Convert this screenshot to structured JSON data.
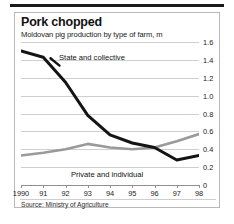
{
  "header": {
    "title": "Pork chopped",
    "subtitle": "Moldovan pig production by type of farm, m"
  },
  "footer": {
    "source": "Source: Ministry of Agriculture"
  },
  "colors": {
    "series_state": "#141414",
    "series_private": "#9a9a9a",
    "gridline": "#cfcfcf",
    "axis": "#8f8f8f",
    "frame": "#b9b9b9",
    "top_rule": "#1a1a1a",
    "text": "#1b1b1b",
    "background": "#ffffff"
  },
  "chart_data": {
    "type": "line",
    "title": "Pork chopped",
    "subtitle": "Moldovan pig production by type of farm, m",
    "xlabel": "",
    "ylabel": "",
    "categories": [
      "1990",
      "91",
      "92",
      "93",
      "94",
      "95",
      "96",
      "97",
      "98"
    ],
    "x_tick_labels": [
      "1990",
      "91",
      "92",
      "93",
      "94",
      "95",
      "96",
      "97",
      "98"
    ],
    "y_tick_labels": [
      "1.6",
      "1.4",
      "1.2",
      "1.0",
      "0.8",
      "0.6",
      "0.4",
      "0.2",
      "0"
    ],
    "y_ticks": [
      1.6,
      1.4,
      1.2,
      1.0,
      0.8,
      0.6,
      0.4,
      0.2,
      0
    ],
    "ylim": [
      0,
      1.6
    ],
    "grid": true,
    "legend_position": "inline-annotation",
    "series": [
      {
        "name": "State and collective",
        "color": "#141414",
        "values": [
          1.5,
          1.43,
          1.15,
          0.78,
          0.56,
          0.47,
          0.42,
          0.28,
          0.33
        ]
      },
      {
        "name": "Private and individual",
        "color": "#9a9a9a",
        "values": [
          0.33,
          0.36,
          0.4,
          0.46,
          0.42,
          0.4,
          0.42,
          0.49,
          0.57
        ]
      }
    ],
    "annotations": [
      {
        "text": "State and collective",
        "series": "State and collective"
      },
      {
        "text": "Private and individual",
        "series": "Private and individual"
      }
    ],
    "source": "Source: Ministry of Agriculture"
  }
}
